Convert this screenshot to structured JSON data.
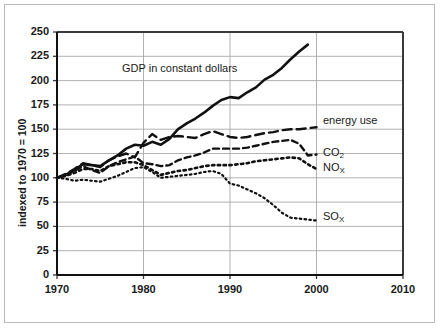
{
  "chart_data": {
    "type": "line",
    "title": "",
    "xlabel": "",
    "ylabel": "indexed to 1970 = 100",
    "xlim": [
      1970,
      2010
    ],
    "ylim": [
      0,
      250
    ],
    "xticks": [
      1970,
      1980,
      1990,
      2000,
      2010
    ],
    "yticks": [
      0,
      25,
      50,
      75,
      100,
      125,
      150,
      175,
      200,
      225,
      250
    ],
    "grid": "horizontal-and-vertical",
    "legend_position": "inline-annotations",
    "annotations": [
      {
        "text": "GDP in constant dollars",
        "x": 1983,
        "y": 213
      },
      {
        "text": "energy use",
        "x": 2001,
        "y": 158
      },
      {
        "text": "CO2",
        "x": 2001,
        "y": 126
      },
      {
        "text": "NOx",
        "x": 2001,
        "y": 112
      },
      {
        "text": "SOx",
        "x": 2001,
        "y": 63
      }
    ],
    "series": [
      {
        "name": "GDP in constant dollars",
        "style": "solid",
        "color": "#111111",
        "width": 2.6,
        "x": [
          1970,
          1971,
          1972,
          1973,
          1974,
          1975,
          1976,
          1977,
          1978,
          1979,
          1980,
          1981,
          1982,
          1983,
          1984,
          1985,
          1986,
          1987,
          1988,
          1989,
          1990,
          1991,
          1992,
          1993,
          1994,
          1995,
          1996,
          1997,
          1998,
          1999
        ],
        "values": [
          100,
          103,
          108,
          114,
          113,
          112,
          118,
          123,
          130,
          134,
          133,
          137,
          134,
          140,
          150,
          156,
          161,
          167,
          174,
          180,
          183,
          182,
          188,
          193,
          201,
          206,
          213,
          222,
          230,
          237
        ]
      },
      {
        "name": "energy use",
        "style": "dashed-long",
        "color": "#111111",
        "width": 2.4,
        "x": [
          1970,
          1971,
          1972,
          1973,
          1974,
          1975,
          1976,
          1977,
          1978,
          1979,
          1980,
          1981,
          1982,
          1983,
          1984,
          1985,
          1986,
          1987,
          1988,
          1989,
          1990,
          1991,
          1992,
          1993,
          1994,
          1995,
          1996,
          1997,
          1998,
          1999,
          2000
        ],
        "values": [
          100,
          104,
          109,
          115,
          113,
          111,
          118,
          122,
          125,
          121,
          136,
          145,
          139,
          142,
          143,
          142,
          141,
          145,
          148,
          145,
          142,
          141,
          142,
          144,
          146,
          147,
          149,
          150,
          150,
          151,
          152
        ]
      },
      {
        "name": "CO2",
        "style": "dashed-short",
        "color": "#111111",
        "width": 2.4,
        "x": [
          1970,
          1971,
          1972,
          1973,
          1974,
          1975,
          1976,
          1977,
          1978,
          1979,
          1980,
          1981,
          1982,
          1983,
          1984,
          1985,
          1986,
          1987,
          1988,
          1989,
          1990,
          1991,
          1992,
          1993,
          1994,
          1995,
          1996,
          1997,
          1998,
          1999,
          2000
        ],
        "values": [
          100,
          103,
          107,
          112,
          108,
          105,
          112,
          116,
          119,
          122,
          115,
          114,
          112,
          113,
          118,
          121,
          123,
          126,
          130,
          130,
          130,
          130,
          131,
          133,
          135,
          137,
          138,
          139,
          135,
          123,
          124
        ]
      },
      {
        "name": "NOx",
        "style": "dotted-heavy",
        "color": "#111111",
        "width": 2.6,
        "x": [
          1970,
          1971,
          1972,
          1973,
          1974,
          1975,
          1976,
          1977,
          1978,
          1979,
          1980,
          1981,
          1982,
          1983,
          1984,
          1985,
          1986,
          1987,
          1988,
          1989,
          1990,
          1991,
          1992,
          1993,
          1994,
          1995,
          1996,
          1997,
          1998,
          1999,
          2000
        ],
        "values": [
          100,
          102,
          105,
          109,
          109,
          107,
          112,
          114,
          116,
          116,
          113,
          108,
          103,
          105,
          107,
          108,
          110,
          112,
          113,
          113,
          113,
          114,
          115,
          117,
          118,
          119,
          120,
          121,
          120,
          114,
          109
        ]
      },
      {
        "name": "SOx",
        "style": "dotted-fine",
        "color": "#111111",
        "width": 2.2,
        "x": [
          1970,
          1971,
          1972,
          1973,
          1974,
          1975,
          1976,
          1977,
          1978,
          1979,
          1980,
          1981,
          1982,
          1983,
          1984,
          1985,
          1986,
          1987,
          1988,
          1989,
          1990,
          1991,
          1992,
          1993,
          1994,
          1995,
          1996,
          1997,
          1998,
          1999,
          2000
        ],
        "values": [
          100,
          99,
          97,
          98,
          97,
          96,
          99,
          102,
          106,
          110,
          111,
          106,
          100,
          101,
          102,
          103,
          104,
          106,
          107,
          104,
          94,
          92,
          88,
          84,
          79,
          72,
          64,
          59,
          58,
          57,
          56
        ]
      }
    ]
  },
  "axis": {
    "yticks_display": [
      "250",
      "225",
      "200",
      "175",
      "150",
      "125",
      "100",
      "75",
      "50",
      "25",
      "0"
    ],
    "xticks_display": [
      "1970",
      "1980",
      "1990",
      "2000",
      "2010"
    ],
    "ylabel_display": "indexed to 1970 = 100"
  },
  "labels": {
    "gdp": "GDP in constant dollars",
    "energy_use": "energy use",
    "co2_main": "CO",
    "co2_sub": "2",
    "nox_main": "NO",
    "nox_sub": "X",
    "sox_main": "SO",
    "sox_sub": "X"
  },
  "colors": {
    "line": "#111111",
    "grid": "#a8a8a8",
    "axis": "#3a3a3a",
    "frame": "#b9b9b9",
    "background": "#ffffff",
    "text": "#1a1a1a"
  }
}
